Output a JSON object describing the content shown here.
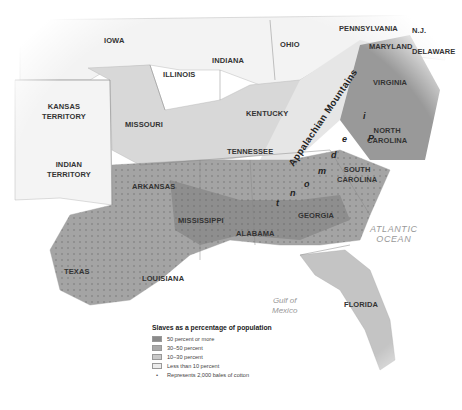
{
  "map": {
    "title": "Slaves as a percentage of population",
    "states": [
      {
        "id": "iowa",
        "label": "IOWA",
        "x": 116,
        "y": 38
      },
      {
        "id": "illinois",
        "label": "ILLINOIS",
        "x": 178,
        "y": 72
      },
      {
        "id": "indiana",
        "label": "INDIANA",
        "x": 226,
        "y": 58
      },
      {
        "id": "ohio",
        "label": "OHIO",
        "x": 290,
        "y": 42
      },
      {
        "id": "pennsylvania",
        "label": "PENNSYLVANIA",
        "x": 363,
        "y": 26
      },
      {
        "id": "nj",
        "label": "N.J.",
        "x": 418,
        "y": 28
      },
      {
        "id": "maryland",
        "label": "MARYLAND",
        "x": 389,
        "y": 44
      },
      {
        "id": "delaware",
        "label": "DELAWARE",
        "x": 433,
        "y": 49
      },
      {
        "id": "kansas",
        "label": "KANSAS\nTERRITORY",
        "x": 59,
        "y": 107
      },
      {
        "id": "missouri",
        "label": "MISSOURI",
        "x": 141,
        "y": 122
      },
      {
        "id": "kentucky",
        "label": "KENTUCKY",
        "x": 263,
        "y": 111
      },
      {
        "id": "virginia",
        "label": "VIRGINIA",
        "x": 389,
        "y": 80
      },
      {
        "id": "indian",
        "label": "INDIAN\nTERRITORY",
        "x": 63,
        "y": 165
      },
      {
        "id": "tennessee",
        "label": "TENNESSEE",
        "x": 246,
        "y": 149
      },
      {
        "id": "north_carolina",
        "label": "NORTH\nCAROLINA",
        "x": 384,
        "y": 134
      },
      {
        "id": "arkansas",
        "label": "ARKANSAS",
        "x": 149,
        "y": 184
      },
      {
        "id": "south_carolina",
        "label": "SOUTH\nCAROLINA",
        "x": 354,
        "y": 173
      },
      {
        "id": "mississippi",
        "label": "MISSISSIPPI",
        "x": 197,
        "y": 218
      },
      {
        "id": "georgia",
        "label": "GEORGIA",
        "x": 314,
        "y": 213
      },
      {
        "id": "alabama",
        "label": "ALABAMA",
        "x": 252,
        "y": 231
      },
      {
        "id": "texas",
        "label": "TEXAS",
        "x": 76,
        "y": 269
      },
      {
        "id": "louisiana",
        "label": "LOUISIANA",
        "x": 160,
        "y": 276
      },
      {
        "id": "florida",
        "label": "FLORIDA",
        "x": 359,
        "y": 302
      }
    ],
    "water": [
      {
        "id": "atlantic",
        "label": "ATLANTIC\nOCEAN",
        "x": 392,
        "y": 230
      },
      {
        "id": "gulf",
        "label": "Gulf of\nMexico",
        "x": 288,
        "y": 302
      }
    ],
    "features": {
      "mountains": "Appalachian Mountains",
      "piedmont": [
        "P",
        "i",
        "e",
        "d",
        "m",
        "o",
        "n",
        "t"
      ]
    }
  },
  "legend": {
    "title": "Slaves as a percentage of population",
    "items": [
      {
        "label": "50 percent or more",
        "color": "#8a8a8a"
      },
      {
        "label": "30–50 percent",
        "color": "#a9a9a9"
      },
      {
        "label": "10–30 percent",
        "color": "#c9c9c9"
      },
      {
        "label": "Less than 10 percent",
        "color": "#ececec"
      }
    ],
    "dot_label": "Represents 2,000 bales of cotton",
    "dot_symbol": "•"
  }
}
